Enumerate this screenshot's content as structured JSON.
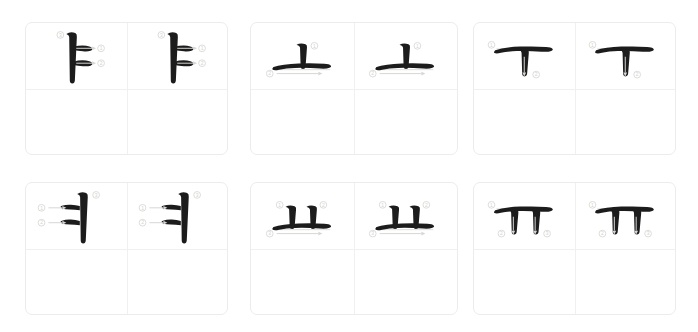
{
  "page": {
    "background_color": "#ffffff",
    "layout": {
      "rows": 2,
      "columns": 3,
      "cells_per_card": 4
    }
  },
  "style": {
    "ink_color": "#1c1c1c",
    "card_border_color": "#ececec",
    "grid_line_color": "#f0f0f0",
    "guide_color": "#dededc",
    "number_color": "#d2d2d0"
  },
  "cards": [
    {
      "id": "card-ya",
      "jamo": "ㅑ",
      "romanization": "ya",
      "glyph_type": "vertical-with-two-right-branches",
      "stroke_count": 3,
      "strokes": [
        {
          "number": "①",
          "direction": "left-to-right",
          "label": "upper horizontal branch"
        },
        {
          "number": "②",
          "direction": "left-to-right",
          "label": "lower horizontal branch"
        },
        {
          "number": "③",
          "direction": "top-to-bottom",
          "label": "long vertical stem"
        }
      ],
      "repetitions": 2
    },
    {
      "id": "card-o",
      "jamo": "ㅗ",
      "romanization": "o",
      "glyph_type": "horizontal-with-one-upper-stem",
      "stroke_count": 2,
      "strokes": [
        {
          "number": "①",
          "direction": "top-to-bottom",
          "label": "short vertical stem"
        },
        {
          "number": "②",
          "direction": "left-to-right",
          "label": "long horizontal base"
        }
      ],
      "repetitions": 2
    },
    {
      "id": "card-u",
      "jamo": "ㅜ",
      "romanization": "u",
      "glyph_type": "horizontal-with-one-lower-stem",
      "stroke_count": 2,
      "strokes": [
        {
          "number": "①",
          "direction": "left-to-right",
          "label": "long horizontal top"
        },
        {
          "number": "②",
          "direction": "top-to-bottom",
          "label": "short vertical descender"
        }
      ],
      "repetitions": 2
    },
    {
      "id": "card-yeo",
      "jamo": "ㅕ",
      "romanization": "yeo",
      "glyph_type": "vertical-with-two-left-branches",
      "stroke_count": 3,
      "strokes": [
        {
          "number": "①",
          "direction": "left-to-right",
          "label": "upper horizontal branch"
        },
        {
          "number": "②",
          "direction": "left-to-right",
          "label": "lower horizontal branch"
        },
        {
          "number": "③",
          "direction": "top-to-bottom",
          "label": "long vertical stem"
        }
      ],
      "repetitions": 2
    },
    {
      "id": "card-yo",
      "jamo": "ㅛ",
      "romanization": "yo",
      "glyph_type": "horizontal-with-two-upper-stems",
      "stroke_count": 3,
      "strokes": [
        {
          "number": "①",
          "direction": "top-to-bottom",
          "label": "left vertical stem"
        },
        {
          "number": "②",
          "direction": "top-to-bottom",
          "label": "right vertical stem"
        },
        {
          "number": "③",
          "direction": "left-to-right",
          "label": "long horizontal base"
        }
      ],
      "repetitions": 2
    },
    {
      "id": "card-yu",
      "jamo": "ㅠ",
      "romanization": "yu",
      "glyph_type": "horizontal-with-two-lower-stems",
      "stroke_count": 3,
      "strokes": [
        {
          "number": "①",
          "direction": "left-to-right",
          "label": "long horizontal top"
        },
        {
          "number": "②",
          "direction": "top-to-bottom",
          "label": "left vertical descender"
        },
        {
          "number": "③",
          "direction": "top-to-bottom",
          "label": "right vertical descender"
        }
      ],
      "repetitions": 2
    }
  ]
}
